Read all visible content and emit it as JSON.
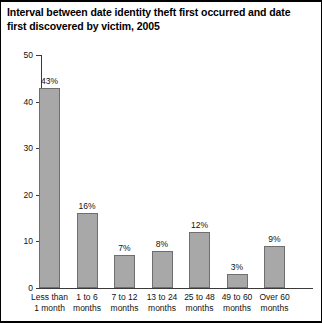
{
  "chart_data": {
    "type": "bar",
    "title": "Interval between date identity theft first occurred and date first discovered by victim, 2005",
    "xlabel": "",
    "ylabel": "",
    "ylim": [
      0,
      50
    ],
    "yticks": [
      "0",
      "10",
      "20",
      "30",
      "40",
      "50"
    ],
    "grid": false,
    "legend": false,
    "categories": [
      "Less than 1 month",
      "1 to 6 months",
      "7 to 12 months",
      "13 to 24 months",
      "25 to 48 months",
      "49 to 60 months",
      "Over 60 months"
    ],
    "category_lines": [
      [
        "Less than",
        "1 month"
      ],
      [
        "1 to 6",
        "months"
      ],
      [
        "7 to 12",
        "months"
      ],
      [
        "13 to 24",
        "months"
      ],
      [
        "25 to 48",
        "months"
      ],
      [
        "49 to 60",
        "months"
      ],
      [
        "Over 60",
        "months"
      ]
    ],
    "values": [
      43,
      16,
      7,
      8,
      12,
      3,
      9
    ],
    "value_labels": [
      "43%",
      "16%",
      "7%",
      "8%",
      "12%",
      "3%",
      "9%"
    ],
    "colors": {
      "bar_fill": "#a8a8a8",
      "bar_border": "#6f6f6f",
      "axis": "#3a3a3a",
      "text": "#111111",
      "frame": "#000000",
      "background": "#ffffff"
    }
  }
}
